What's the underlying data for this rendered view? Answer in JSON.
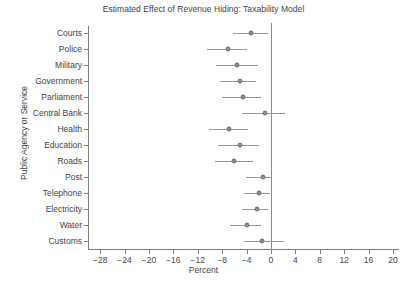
{
  "chart_data": {
    "type": "scatter",
    "title": "Estimated Effect of Revenue Hiding: Taxability Model",
    "xlabel": "Percent",
    "ylabel": "Public Agency or Service",
    "xlim": [
      -30,
      21
    ],
    "xticks": [
      -28,
      -24,
      -20,
      -16,
      -12,
      -8,
      -4,
      0,
      4,
      8,
      12,
      16,
      20
    ],
    "xticklabels": [
      "−28",
      "−24",
      "−20",
      "−16",
      "−12",
      "−8",
      "−4",
      "0",
      "4",
      "8",
      "12",
      "16",
      "20"
    ],
    "grid": false,
    "legend": null,
    "reference_line": 0,
    "marker": "filled-circle-gray",
    "error_bars": "horizontal-confidence-interval",
    "categories": [
      "Courts",
      "Police",
      "Military",
      "Government",
      "Parliament",
      "Central Bank",
      "Health",
      "Education",
      "Roads",
      "Post",
      "Telephone",
      "Electricity",
      "Water",
      "Customs"
    ],
    "values": [
      -3.3,
      -7.1,
      -5.5,
      -5.1,
      -4.6,
      -1.0,
      -6.8,
      -5.1,
      -6.0,
      -1.3,
      -2.0,
      -2.3,
      -4.0,
      -1.5
    ],
    "ci_low": [
      -6.2,
      -10.5,
      -9.0,
      -8.4,
      -8.0,
      -4.8,
      -10.2,
      -8.6,
      -9.2,
      -4.1,
      -4.4,
      -4.8,
      -6.7,
      -4.5
    ],
    "ci_high": [
      -0.5,
      -4.0,
      -2.2,
      -2.4,
      -1.6,
      2.3,
      -3.8,
      -2.0,
      -3.0,
      0.2,
      -0.2,
      -0.4,
      -1.6,
      2.2
    ],
    "points": [
      {
        "label": "Courts",
        "value": -3.3,
        "ci_low": -6.2,
        "ci_high": -0.5
      },
      {
        "label": "Police",
        "value": -7.1,
        "ci_low": -10.5,
        "ci_high": -4.0
      },
      {
        "label": "Military",
        "value": -5.5,
        "ci_low": -9.0,
        "ci_high": -2.2
      },
      {
        "label": "Government",
        "value": -5.1,
        "ci_low": -8.4,
        "ci_high": -2.4
      },
      {
        "label": "Parliament",
        "value": -4.6,
        "ci_low": -8.0,
        "ci_high": -1.6
      },
      {
        "label": "Central Bank",
        "value": -1.0,
        "ci_low": -4.8,
        "ci_high": 2.3
      },
      {
        "label": "Health",
        "value": -6.8,
        "ci_low": -10.2,
        "ci_high": -3.8
      },
      {
        "label": "Education",
        "value": -5.1,
        "ci_low": -8.6,
        "ci_high": -2.0
      },
      {
        "label": "Roads",
        "value": -6.0,
        "ci_low": -9.2,
        "ci_high": -3.0
      },
      {
        "label": "Post",
        "value": -1.3,
        "ci_low": -4.1,
        "ci_high": 0.2
      },
      {
        "label": "Telephone",
        "value": -2.0,
        "ci_low": -4.4,
        "ci_high": -0.2
      },
      {
        "label": "Electricity",
        "value": -2.3,
        "ci_low": -4.8,
        "ci_high": -0.4
      },
      {
        "label": "Water",
        "value": -4.0,
        "ci_low": -6.7,
        "ci_high": -1.6
      },
      {
        "label": "Customs",
        "value": -1.5,
        "ci_low": -4.5,
        "ci_high": 2.2
      }
    ]
  },
  "colors": {
    "axis": "#7d7d7d",
    "marker_fill": "#8e8e8e",
    "marker_edge": "#6f6f6f",
    "ci_line": "#9a9a9a",
    "zero_line": "#8a8a8a",
    "text": "#444444",
    "background": "#ffffff"
  }
}
